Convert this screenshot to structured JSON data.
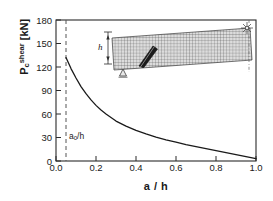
{
  "chart_data": {
    "type": "line",
    "title": "",
    "xlabel": "a / h",
    "ylabel": "P_c^shear [kN]",
    "ylabel_base": "P",
    "ylabel_sub": "c",
    "ylabel_sup": "shear",
    "ylabel_unit": "[kN]",
    "xlim": [
      0.0,
      1.0
    ],
    "ylim": [
      0,
      180
    ],
    "xticks": [
      "0.0",
      "0.2",
      "0.4",
      "0.6",
      "0.8",
      "1.0"
    ],
    "xtick_values": [
      0.0,
      0.2,
      0.4,
      0.6,
      0.8,
      1.0
    ],
    "yticks": [
      "0",
      "30",
      "60",
      "90",
      "120",
      "150",
      "180"
    ],
    "ytick_values": [
      0,
      30,
      60,
      90,
      120,
      150,
      180
    ],
    "grid": false,
    "legend": "none",
    "series": [
      {
        "name": "Pc shear",
        "style": "solid",
        "color": "#1a1a1a",
        "x": [
          0.05,
          0.075,
          0.1,
          0.125,
          0.15,
          0.175,
          0.2,
          0.225,
          0.25,
          0.3,
          0.35,
          0.4,
          0.45,
          0.5,
          0.55,
          0.6,
          0.65,
          0.7,
          0.75,
          0.8,
          0.85,
          0.9,
          0.95,
          1.0
        ],
        "y": [
          132,
          118,
          106,
          95,
          86,
          78,
          71,
          65,
          60,
          51,
          44.5,
          39,
          34.5,
          30.5,
          27,
          24,
          21,
          18.3,
          15.7,
          13.2,
          10.7,
          8.2,
          5.6,
          3.0
        ]
      }
    ],
    "annotations": [
      {
        "name": "a0-over-h",
        "text_base": "a",
        "text_sub": "0",
        "text_rest": "/h",
        "x": 0.07,
        "y": 22
      }
    ],
    "reference_lines": [
      {
        "name": "a0-dashed-line",
        "orientation": "vertical",
        "x": 0.05,
        "style": "dashed",
        "color": "#555555"
      }
    ]
  },
  "inset": {
    "name": "fem-beam-mesh-diagram",
    "h_label": "h",
    "elements": {
      "mesh": "tilted-rectangular-finite-element-mesh",
      "crack": "diagonal-shear-crack",
      "support": "roller-support-triangle",
      "load": "point-load-arrow",
      "dimension": "height-dimension-arrow"
    }
  }
}
